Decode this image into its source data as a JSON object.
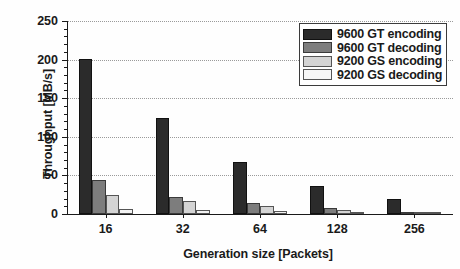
{
  "chart_data": {
    "type": "bar",
    "title": "",
    "xlabel": "Generation size [Packets]",
    "ylabel": "Throughput [MB/s]",
    "categories": [
      "16",
      "32",
      "64",
      "128",
      "256"
    ],
    "ylim": [
      0,
      250
    ],
    "yticks": [
      0,
      50,
      100,
      150,
      200,
      250
    ],
    "yticklabels": [
      "0",
      "50",
      "100",
      "150",
      "200",
      "250"
    ],
    "grid": true,
    "grid_axis": "y",
    "legend_position": "upper right",
    "series": [
      {
        "name": "9600 GT encoding",
        "color": "#2b2b2b",
        "values": [
          201,
          124,
          67,
          36,
          19
        ]
      },
      {
        "name": "9600 GT decoding",
        "color": "#7d7d7d",
        "values": [
          44,
          22,
          14,
          8,
          3
        ]
      },
      {
        "name": "9200 GS encoding",
        "color": "#d4d4d4",
        "values": [
          25,
          17,
          10,
          5,
          2
        ]
      },
      {
        "name": "9200 GS decoding",
        "color": "#f2f2f2",
        "values": [
          6,
          5,
          4,
          2,
          1
        ]
      }
    ]
  }
}
